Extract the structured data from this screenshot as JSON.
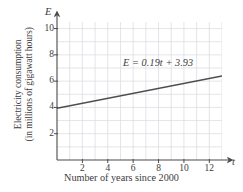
{
  "chart_data": {
    "type": "line",
    "title": "",
    "xlabel": "Number of years since 2000",
    "ylabel_line1": "Electricity consumption",
    "ylabel_line2": "(in millions of gigawatt hours)",
    "x_var": "t",
    "y_var": "E",
    "xlim": [
      0,
      13
    ],
    "ylim": [
      0,
      10.5
    ],
    "xticks": [
      2,
      4,
      6,
      8,
      10,
      12
    ],
    "yticks": [
      2,
      4,
      6,
      8,
      10
    ],
    "xtick_labels": [
      "2",
      "4",
      "6",
      "8",
      "10",
      "12"
    ],
    "ytick_labels": [
      "2",
      "4",
      "6",
      "8",
      "10"
    ],
    "grid": true,
    "grid_step_x": 1,
    "grid_step_y": 1,
    "grid_color": "#d9d9e0",
    "legend": "none",
    "annotation": "E = 0.19t + 3.93",
    "series": [
      {
        "name": "E = 0.19t + 3.93",
        "type": "line",
        "slope": 0.19,
        "intercept": 3.93,
        "color": "#4d4d4d",
        "x": [
          0,
          13
        ],
        "values": [
          3.93,
          6.4
        ]
      }
    ]
  },
  "colors": {
    "axis": "#4a4a4a",
    "grid": "#d9d9e0",
    "line": "#4d4d4d",
    "text": "#3c3c3c",
    "background": "#ffffff"
  }
}
